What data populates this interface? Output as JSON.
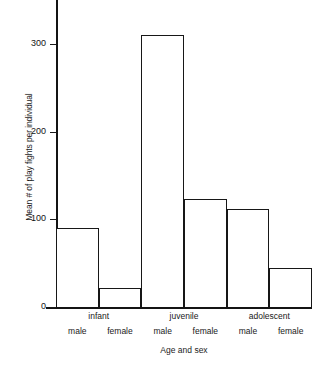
{
  "chart_data": {
    "type": "bar",
    "title": "",
    "xlabel": "Age and sex",
    "ylabel": "Mean # of play fights per individual",
    "ylim": [
      0,
      340
    ],
    "yticks": [
      0,
      100,
      200,
      300
    ],
    "ytick_labels": [
      "0",
      "100",
      "200",
      "300"
    ],
    "grid": false,
    "legend": null,
    "categories": [
      "infant male",
      "infant female",
      "juvenile male",
      "juvenile female",
      "adolescent male",
      "adolescent female"
    ],
    "values": [
      90,
      22,
      310,
      123,
      112,
      44
    ],
    "group_labels": [
      "infant",
      "juvenile",
      "adolescent"
    ],
    "sex_labels": [
      "male",
      "female",
      "male",
      "female",
      "male",
      "female"
    ],
    "bar_style": {
      "fill": "#ffffff",
      "edge": "#171717",
      "contiguous": true
    }
  },
  "axis": {
    "y_title": "Mean # of play fights per individual",
    "x_title": "Age and sex",
    "y_ticks": [
      {
        "label": "300",
        "value": 300
      },
      {
        "label": "200",
        "value": 200
      },
      {
        "label": "100",
        "value": 100
      },
      {
        "label": "0",
        "value": 0
      }
    ]
  },
  "groups": [
    {
      "label": "infant"
    },
    {
      "label": "juvenile"
    },
    {
      "label": "adolescent"
    }
  ],
  "bars": [
    {
      "sex": "male",
      "group": "infant",
      "value": 90
    },
    {
      "sex": "female",
      "group": "infant",
      "value": 22
    },
    {
      "sex": "male",
      "group": "juvenile",
      "value": 310
    },
    {
      "sex": "female",
      "group": "juvenile",
      "value": 123
    },
    {
      "sex": "male",
      "group": "adolescent",
      "value": 112
    },
    {
      "sex": "female",
      "group": "adolescent",
      "value": 44
    }
  ],
  "caption": {
    "text": ""
  }
}
